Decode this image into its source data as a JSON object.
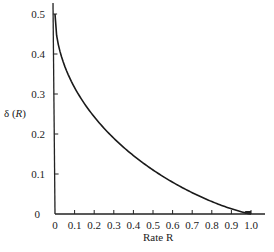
{
  "chart_data": {
    "type": "line",
    "title": "",
    "xlabel": "Rate R",
    "ylabel": "δ (R)",
    "xlim": [
      0,
      1.0
    ],
    "ylim": [
      0,
      0.5
    ],
    "grid": false,
    "legend": null,
    "x_ticks": [
      "0",
      "0.1",
      "0.2",
      "0.3",
      "0.4",
      "0.5",
      "0.6",
      "0.7",
      "0.8",
      "0.9",
      "1.0"
    ],
    "y_ticks": [
      "0",
      "0.1",
      "0.2",
      "0.3",
      "0.4",
      "0.5"
    ],
    "series": [
      {
        "name": "δ(R)",
        "x": [
          0,
          0.05,
          0.1,
          0.15,
          0.2,
          0.25,
          0.3,
          0.35,
          0.4,
          0.45,
          0.5,
          0.55,
          0.6,
          0.65,
          0.7,
          0.75,
          0.8,
          0.85,
          0.9,
          0.95,
          1.0
        ],
        "y": [
          0.5,
          0.369,
          0.316,
          0.277,
          0.243,
          0.214,
          0.189,
          0.166,
          0.146,
          0.127,
          0.11,
          0.094,
          0.079,
          0.065,
          0.053,
          0.041,
          0.031,
          0.021,
          0.013,
          0.006,
          0.0
        ]
      }
    ]
  },
  "labels": {
    "x_axis": "Rate R",
    "y_axis_prefix": "δ (",
    "y_axis_var": "R",
    "y_axis_suffix": ")"
  }
}
